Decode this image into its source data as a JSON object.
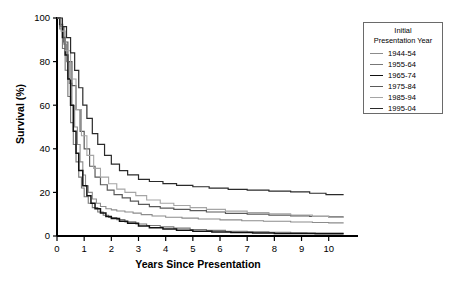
{
  "chart_data": {
    "type": "line",
    "title": "",
    "xlabel": "Years Since Presentation",
    "ylabel": "Survival (%)",
    "xlim": [
      0,
      10.6
    ],
    "ylim": [
      0,
      100
    ],
    "xticks": [
      "0",
      "1",
      "2",
      "3",
      "4",
      "5",
      "6",
      "7",
      "8",
      "9",
      "10"
    ],
    "yticks": [
      "0",
      "20",
      "40",
      "60",
      "80",
      "100"
    ],
    "grid": false,
    "legend_position": "outside-right-top",
    "legend_title": "Initial Presentation Year",
    "legend_title_line1": "Initial",
    "legend_title_line2": "Presentation Year",
    "step_type": "post",
    "series": [
      {
        "name": "1944-54",
        "color": "#8c8c8c",
        "width": 1.1,
        "x": [
          0,
          0.12,
          0.25,
          0.35,
          0.45,
          0.55,
          0.65,
          0.75,
          0.85,
          0.95,
          1.05,
          1.15,
          1.3,
          1.45,
          1.6,
          1.8,
          2.0,
          2.2,
          2.5,
          2.8,
          3.1,
          3.5,
          4.0,
          4.6,
          5.2,
          6.0,
          6.8,
          7.6,
          8.6,
          9.4,
          10.0,
          10.55
        ],
        "y": [
          100,
          96,
          88,
          80,
          70,
          60,
          50,
          42,
          34,
          28,
          23,
          20,
          17,
          15,
          13.5,
          12.5,
          12,
          11.5,
          11,
          10.5,
          9.8,
          9.2,
          8.6,
          8.2,
          7.8,
          7.4,
          7.0,
          6.8,
          6.4,
          6.2,
          6.0,
          6.0
        ]
      },
      {
        "name": "1955-64",
        "color": "#777777",
        "width": 1.1,
        "x": [
          0,
          0.1,
          0.2,
          0.3,
          0.4,
          0.5,
          0.6,
          0.7,
          0.8,
          0.9,
          1.0,
          1.15,
          1.3,
          1.5,
          1.7,
          1.9,
          2.2,
          2.5,
          2.9,
          3.3,
          3.8,
          4.3,
          4.9,
          5.5,
          6.2,
          7.0,
          7.8,
          8.6,
          9.2,
          9.8,
          10.55
        ],
        "y": [
          100,
          95,
          86,
          76,
          64,
          52,
          42,
          34,
          27,
          22,
          18,
          15,
          13,
          11,
          9.5,
          8.5,
          7.5,
          6.5,
          5.5,
          4.8,
          4.2,
          3.6,
          3.0,
          2.6,
          2.2,
          1.9,
          1.7,
          1.5,
          1.4,
          1.3,
          1.3
        ]
      },
      {
        "name": "1965-74",
        "color": "#111111",
        "width": 1.5,
        "x": [
          0,
          0.1,
          0.2,
          0.3,
          0.4,
          0.5,
          0.6,
          0.7,
          0.8,
          0.95,
          1.1,
          1.25,
          1.4,
          1.6,
          1.8,
          2.0,
          2.3,
          2.6,
          3.0,
          3.4,
          3.9,
          4.4,
          5.0,
          5.7,
          6.4,
          7.2,
          8.0,
          8.8,
          9.5,
          10.55
        ],
        "y": [
          100,
          97,
          91,
          83,
          72,
          60,
          48,
          38,
          30,
          23,
          18.5,
          15,
          12.5,
          10.5,
          9,
          8,
          6.8,
          5.8,
          4.6,
          3.8,
          3.2,
          2.6,
          2.2,
          1.8,
          1.6,
          1.4,
          1.2,
          1.1,
          1.0,
          1.0
        ]
      },
      {
        "name": "1975-84",
        "color": "#5a5a5a",
        "width": 1.2,
        "x": [
          0,
          0.12,
          0.25,
          0.4,
          0.55,
          0.7,
          0.85,
          1.0,
          1.2,
          1.4,
          1.6,
          1.85,
          2.1,
          2.4,
          2.7,
          3.0,
          3.4,
          3.8,
          4.3,
          4.9,
          5.5,
          6.2,
          7.0,
          7.8,
          8.6,
          9.3,
          10.0,
          10.55
        ],
        "y": [
          100,
          96,
          89,
          80,
          69,
          58,
          48,
          40,
          32,
          27,
          23.5,
          21,
          19,
          17.5,
          16,
          14.5,
          13.5,
          12.8,
          12.2,
          11.6,
          11.0,
          10.4,
          10.0,
          9.6,
          9.2,
          9.0,
          8.8,
          8.8
        ]
      },
      {
        "name": "1985-94",
        "color": "#a5a5a5",
        "width": 1.1,
        "x": [
          0,
          0.15,
          0.3,
          0.5,
          0.7,
          0.9,
          1.1,
          1.35,
          1.6,
          1.9,
          2.2,
          2.5,
          2.9,
          3.3,
          3.8,
          4.3,
          4.9,
          5.5,
          6.2,
          7.0,
          7.8,
          8.6,
          9.4,
          10.0,
          10.55
        ],
        "y": [
          100,
          94,
          85,
          72,
          58,
          46,
          37,
          31,
          27,
          24,
          21.5,
          20,
          18.5,
          16.5,
          15,
          14,
          13,
          12.2,
          11.4,
          10.8,
          10.2,
          9.6,
          9.0,
          8.6,
          8.6
        ]
      },
      {
        "name": "1995-04",
        "color": "#2a2a2a",
        "width": 1.2,
        "x": [
          0,
          0.2,
          0.35,
          0.5,
          0.65,
          0.8,
          0.95,
          1.1,
          1.3,
          1.5,
          1.75,
          2.0,
          2.3,
          2.6,
          3.0,
          3.4,
          3.9,
          4.4,
          5.0,
          5.6,
          6.3,
          7.0,
          7.8,
          8.6,
          9.3,
          9.9,
          10.55
        ],
        "y": [
          100,
          96,
          91,
          84,
          76,
          68,
          60,
          54,
          47,
          42,
          37,
          33,
          30,
          28,
          26,
          25,
          24,
          23.2,
          22.6,
          22.0,
          21.4,
          21.0,
          20.6,
          20.2,
          19.6,
          19.0,
          19.0
        ]
      }
    ]
  }
}
